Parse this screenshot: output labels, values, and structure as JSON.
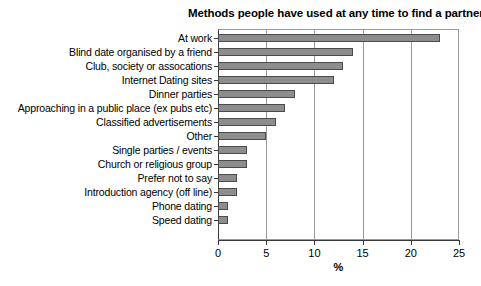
{
  "chart_data": {
    "type": "bar",
    "orientation": "horizontal",
    "title": "Methods people have used at any time to find a partner?",
    "xlabel": "%",
    "ylabel": "",
    "xlim": [
      0,
      25
    ],
    "xticks": [
      0,
      5,
      10,
      15,
      20,
      25
    ],
    "xtick_labels": [
      "0",
      "5",
      "10",
      "15",
      "20",
      "25"
    ],
    "grid": "vertical",
    "legend": "none",
    "bar_color": "#8d8d8d",
    "bar_edge_color": "#4a4a4a",
    "categories": [
      "At work",
      "Blind date organised by a friend",
      "Club, society or assocations",
      "Internet Dating sites",
      "Dinner parties",
      "Approaching in a public place (ex pubs etc)",
      "Classified advertisements",
      "Other",
      "Single parties / events",
      "Church or religious group",
      "Prefer not to say",
      "Introduction agency (off line)",
      "Phone dating",
      "Speed dating"
    ],
    "values": [
      23,
      14,
      13,
      12,
      8,
      7,
      6,
      5,
      3,
      3,
      2,
      2,
      1,
      1
    ]
  }
}
